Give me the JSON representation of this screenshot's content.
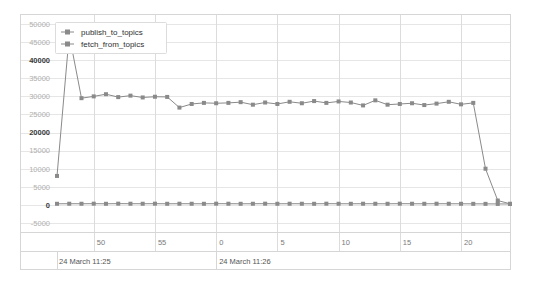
{
  "chart_data": {
    "type": "line",
    "title": "",
    "xlabel": "",
    "ylabel": "",
    "ylim": [
      -7500,
      52500
    ],
    "yticks": [
      50000,
      45000,
      40000,
      35000,
      30000,
      25000,
      20000,
      15000,
      10000,
      5000,
      0,
      -5000
    ],
    "ytick_labels": [
      "50000",
      "45000",
      "40000",
      "35000",
      "30000",
      "25000",
      "20000",
      "15000",
      "10000",
      "5000",
      "0",
      "-5000"
    ],
    "ytick_major": [
      "40000",
      "20000",
      "0"
    ],
    "grid": true,
    "legend_position": "top-left",
    "xticks": [
      50,
      55,
      0,
      5,
      10,
      15,
      20
    ],
    "xtick_labels": [
      "50",
      "55",
      "0",
      "5",
      "10",
      "15",
      "20"
    ],
    "x_range_labels": [
      "24 March 11:25",
      "24 March 11:26"
    ],
    "x_start_second": 47,
    "x_end_second": 23,
    "series": [
      {
        "name": "publish_to_topics",
        "color": "#8a8a8a",
        "marker": "square",
        "values": [
          8000,
          47000,
          29500,
          30000,
          30600,
          29800,
          30200,
          29700,
          29900,
          29850,
          26900,
          27900,
          28200,
          28100,
          28200,
          28400,
          27700,
          28300,
          27900,
          28500,
          28100,
          28700,
          28200,
          28600,
          28300,
          27500,
          28900,
          27700,
          27900,
          28100,
          27600,
          28000,
          28500,
          27800,
          28200,
          10000,
          1200,
          300
        ]
      },
      {
        "name": "fetch_from_topics",
        "color": "#8a8a8a",
        "marker": "square",
        "values": [
          300,
          320,
          310,
          330,
          300,
          340,
          320,
          310,
          330,
          300,
          320,
          310,
          300,
          330,
          320,
          300,
          310,
          330,
          300,
          320,
          310,
          300,
          330,
          310,
          300,
          320,
          310,
          300,
          330,
          310,
          300,
          320,
          310,
          300,
          290,
          280,
          260,
          250
        ]
      }
    ]
  },
  "legend": {
    "items": [
      {
        "label": "publish_to_topics"
      },
      {
        "label": "fetch_from_topics"
      }
    ]
  }
}
